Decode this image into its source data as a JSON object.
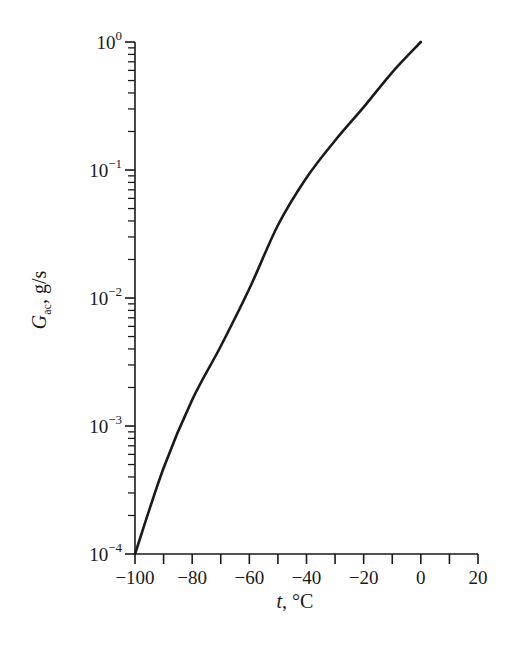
{
  "chart_data": {
    "type": "line",
    "title": "",
    "xlabel": "t, °C",
    "xlabel_var": "t",
    "xlabel_unit": ", °C",
    "ylabel": "G_ac, g/s",
    "ylabel_var": "G",
    "ylabel_sub": "ac",
    "ylabel_unit": ", g/s",
    "xlim": [
      -100,
      20
    ],
    "ylim": [
      0.0001,
      1
    ],
    "yscale": "log",
    "grid": false,
    "legend": null,
    "x_ticks": [
      -100,
      -80,
      -60,
      -40,
      -20,
      0,
      20
    ],
    "x_tick_labels": [
      "−100",
      "−80",
      "−60",
      "−40",
      "−20",
      "0",
      "20"
    ],
    "x_minor_ticks": [
      -90,
      -70,
      -50,
      -30,
      -10,
      10
    ],
    "y_ticks": [
      1,
      0.1,
      0.01,
      0.001,
      0.0001
    ],
    "y_tick_labels": [
      {
        "base": "10",
        "exp": "0"
      },
      {
        "base": "10",
        "exp": "−1"
      },
      {
        "base": "10",
        "exp": "−2"
      },
      {
        "base": "10",
        "exp": "−3"
      },
      {
        "base": "10",
        "exp": "−4"
      }
    ],
    "series": [
      {
        "name": "G_ac",
        "color": "#1a1a1a",
        "x": [
          -100,
          -90,
          -80,
          -70,
          -60,
          -50,
          -40,
          -30,
          -20,
          -10,
          0
        ],
        "y": [
          0.0001,
          0.00047,
          0.0016,
          0.0042,
          0.0118,
          0.037,
          0.087,
          0.17,
          0.31,
          0.58,
          1.0
        ]
      }
    ]
  }
}
